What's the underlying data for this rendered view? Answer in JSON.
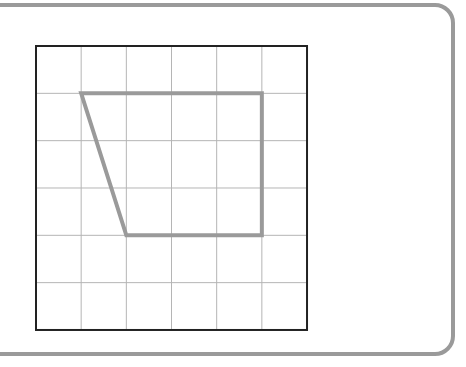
{
  "diagram": {
    "type": "grid-shape",
    "grid": {
      "columns": 6,
      "rows": 6,
      "origin_px": [
        36,
        46
      ],
      "cell_w_px": 45.17,
      "cell_h_px": 47.33,
      "gridline_color": "#b5b5b5",
      "border_color": "#222222"
    },
    "shape": {
      "name": "trapezoid",
      "vertices_grid": [
        [
          1,
          1
        ],
        [
          5,
          1
        ],
        [
          5,
          4
        ],
        [
          2,
          4
        ]
      ],
      "stroke_color": "#9a9a9a",
      "stroke_width": 4
    },
    "frame": {
      "stroke_color": "#9a9a9a",
      "corner_radius": 20
    }
  }
}
